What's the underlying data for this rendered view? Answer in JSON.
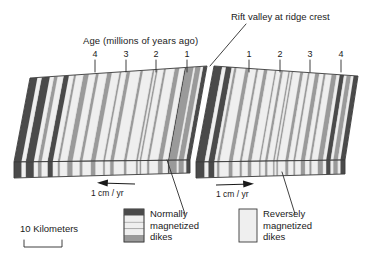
{
  "figure": {
    "kind": "seafloor-spreading-block-diagram",
    "callout_ridge": "Rift valley at ridge crest",
    "axis_title": "Age (millions of years ago)",
    "ticks_left": [
      "4",
      "3",
      "2",
      "1"
    ],
    "ticks_right": [
      "1",
      "2",
      "3",
      "4"
    ],
    "rate_left": "1 cm / yr",
    "rate_right": "1 cm / yr",
    "scale_label": "10 Kilometers",
    "legend": [
      {
        "id": "normally-magnetized",
        "line1": "Normally",
        "line2": "magnetized",
        "line3": "dikes",
        "swatch": "banded-dark"
      },
      {
        "id": "reversely-magnetized",
        "line1": "Reversely",
        "line2": "magnetized",
        "line3": "dikes",
        "swatch": "plain-light"
      }
    ],
    "colors": {
      "ink": "#1a1a1a",
      "dark_stripe": "#4a4a4a",
      "mid_stripe": "#9a9a9a",
      "light_stripe": "#efefef",
      "outline": "#3a3a3a",
      "front_face": "#d8d8d8",
      "background": "#ffffff"
    }
  },
  "chart_data": {
    "type": "diagram",
    "title": "Rift valley at ridge crest",
    "xlabel": "Age (millions of years ago)",
    "ylabel": "",
    "grid": false,
    "legend_position": "bottom",
    "axis_left": {
      "tick_labels": [
        "4",
        "3",
        "2",
        "1"
      ],
      "tick_x": [
        95,
        126,
        156,
        187
      ],
      "direction": "older-outward"
    },
    "axis_right": {
      "tick_labels": [
        "1",
        "2",
        "3",
        "4"
      ],
      "tick_x": [
        249,
        280,
        310,
        341
      ],
      "direction": "older-outward"
    },
    "spreading_rate": {
      "left": "1 cm / yr",
      "right": "1 cm / yr",
      "value": 1,
      "unit": "cm/yr"
    },
    "scale_bar": {
      "label": "10 Kilometers",
      "value": 10,
      "unit": "Kilometers"
    },
    "series": [
      {
        "name": "Normally magnetized dikes",
        "tone": "dark"
      },
      {
        "name": "Reversely magnetized dikes",
        "tone": "light"
      }
    ],
    "left_block_stripes": [
      {
        "p": 0.0,
        "w": 0.022,
        "t": "dark"
      },
      {
        "p": 0.022,
        "w": 0.014,
        "t": "light"
      },
      {
        "p": 0.036,
        "w": 0.03,
        "t": "mid"
      },
      {
        "p": 0.066,
        "w": 0.01,
        "t": "light"
      },
      {
        "p": 0.076,
        "w": 0.042,
        "t": "mid"
      },
      {
        "p": 0.118,
        "w": 0.008,
        "t": "dark"
      },
      {
        "p": 0.126,
        "w": 0.03,
        "t": "light"
      },
      {
        "p": 0.156,
        "w": 0.026,
        "t": "mid"
      },
      {
        "p": 0.182,
        "w": 0.05,
        "t": "light"
      },
      {
        "p": 0.232,
        "w": 0.012,
        "t": "mid"
      },
      {
        "p": 0.244,
        "w": 0.034,
        "t": "light"
      },
      {
        "p": 0.278,
        "w": 0.009,
        "t": "mid"
      },
      {
        "p": 0.287,
        "w": 0.01,
        "t": "light"
      },
      {
        "p": 0.297,
        "w": 0.01,
        "t": "mid"
      },
      {
        "p": 0.307,
        "w": 0.055,
        "t": "light"
      },
      {
        "p": 0.362,
        "w": 0.014,
        "t": "mid"
      },
      {
        "p": 0.376,
        "w": 0.058,
        "t": "light"
      },
      {
        "p": 0.434,
        "w": 0.02,
        "t": "mid"
      },
      {
        "p": 0.454,
        "w": 0.03,
        "t": "light"
      },
      {
        "p": 0.484,
        "w": 0.01,
        "t": "mid"
      },
      {
        "p": 0.494,
        "w": 0.044,
        "t": "light"
      },
      {
        "p": 0.538,
        "w": 0.026,
        "t": "mid"
      },
      {
        "p": 0.564,
        "w": 0.048,
        "t": "light"
      },
      {
        "p": 0.612,
        "w": 0.016,
        "t": "mid"
      },
      {
        "p": 0.628,
        "w": 0.04,
        "t": "light"
      },
      {
        "p": 0.668,
        "w": 0.03,
        "t": "mid"
      },
      {
        "p": 0.698,
        "w": 0.042,
        "t": "light"
      },
      {
        "p": 0.74,
        "w": 0.012,
        "t": "mid"
      },
      {
        "p": 0.752,
        "w": 0.028,
        "t": "light"
      },
      {
        "p": 0.78,
        "w": 0.03,
        "t": "dark"
      },
      {
        "p": 0.81,
        "w": 0.034,
        "t": "light"
      },
      {
        "p": 0.844,
        "w": 0.02,
        "t": "mid"
      },
      {
        "p": 0.864,
        "w": 0.024,
        "t": "light"
      },
      {
        "p": 0.888,
        "w": 0.046,
        "t": "dark"
      },
      {
        "p": 0.934,
        "w": 0.024,
        "t": "light"
      },
      {
        "p": 0.958,
        "w": 0.042,
        "t": "dark"
      }
    ],
    "right_block_stripes": [
      {
        "p": 0.0,
        "w": 0.058,
        "t": "dark"
      },
      {
        "p": 0.058,
        "w": 0.026,
        "t": "light"
      },
      {
        "p": 0.084,
        "w": 0.04,
        "t": "dark"
      },
      {
        "p": 0.124,
        "w": 0.018,
        "t": "light"
      },
      {
        "p": 0.142,
        "w": 0.016,
        "t": "mid"
      },
      {
        "p": 0.158,
        "w": 0.062,
        "t": "light"
      },
      {
        "p": 0.22,
        "w": 0.026,
        "t": "mid"
      },
      {
        "p": 0.246,
        "w": 0.048,
        "t": "light"
      },
      {
        "p": 0.294,
        "w": 0.014,
        "t": "mid"
      },
      {
        "p": 0.308,
        "w": 0.04,
        "t": "light"
      },
      {
        "p": 0.348,
        "w": 0.024,
        "t": "mid"
      },
      {
        "p": 0.372,
        "w": 0.052,
        "t": "light"
      },
      {
        "p": 0.424,
        "w": 0.01,
        "t": "mid"
      },
      {
        "p": 0.434,
        "w": 0.03,
        "t": "light"
      },
      {
        "p": 0.464,
        "w": 0.016,
        "t": "mid"
      },
      {
        "p": 0.48,
        "w": 0.038,
        "t": "light"
      },
      {
        "p": 0.518,
        "w": 0.01,
        "t": "mid"
      },
      {
        "p": 0.528,
        "w": 0.012,
        "t": "light"
      },
      {
        "p": 0.54,
        "w": 0.01,
        "t": "mid"
      },
      {
        "p": 0.55,
        "w": 0.05,
        "t": "light"
      },
      {
        "p": 0.6,
        "w": 0.02,
        "t": "mid"
      },
      {
        "p": 0.62,
        "w": 0.034,
        "t": "light"
      },
      {
        "p": 0.654,
        "w": 0.012,
        "t": "mid"
      },
      {
        "p": 0.666,
        "w": 0.038,
        "t": "light"
      },
      {
        "p": 0.704,
        "w": 0.028,
        "t": "mid"
      },
      {
        "p": 0.732,
        "w": 0.03,
        "t": "light"
      },
      {
        "p": 0.762,
        "w": 0.014,
        "t": "mid"
      },
      {
        "p": 0.776,
        "w": 0.042,
        "t": "light"
      },
      {
        "p": 0.818,
        "w": 0.034,
        "t": "mid"
      },
      {
        "p": 0.852,
        "w": 0.022,
        "t": "light"
      },
      {
        "p": 0.874,
        "w": 0.03,
        "t": "dark"
      },
      {
        "p": 0.904,
        "w": 0.018,
        "t": "light"
      },
      {
        "p": 0.922,
        "w": 0.03,
        "t": "mid"
      },
      {
        "p": 0.952,
        "w": 0.018,
        "t": "light"
      },
      {
        "p": 0.97,
        "w": 0.03,
        "t": "dark"
      }
    ],
    "legend_swatch_bands": [
      "dark",
      "light",
      "light",
      "light",
      "mid"
    ]
  }
}
